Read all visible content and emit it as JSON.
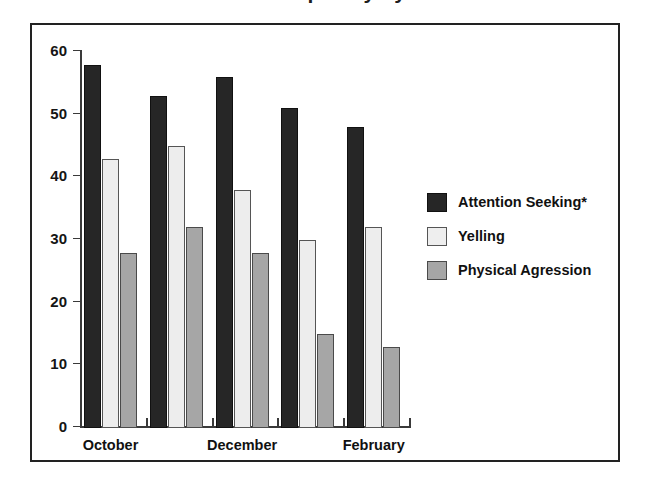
{
  "figure": {
    "title": "Behavior Frequency by Month",
    "frame_border_color": "#222222",
    "background": "#ffffff"
  },
  "chart_data": {
    "type": "bar",
    "title": "Behavior Frequency by Month",
    "xlabel": "",
    "ylabel": "",
    "ylim": [
      0,
      60
    ],
    "yticks": [
      0,
      10,
      20,
      30,
      40,
      50,
      60
    ],
    "ytick_labels": [
      "0",
      "10",
      "20",
      "30",
      "40",
      "50",
      "60"
    ],
    "grid": false,
    "legend_position": "right",
    "categories": [
      "October",
      "",
      "December",
      "",
      "February"
    ],
    "visible_category_labels": [
      "October",
      "December",
      "February"
    ],
    "series": [
      {
        "name": "Attention Seeking*",
        "color": "#262626",
        "values": [
          58,
          53,
          56,
          51,
          48
        ]
      },
      {
        "name": "Yelling",
        "color": "#ededed",
        "values": [
          43,
          45,
          38,
          30,
          32
        ]
      },
      {
        "name": "Physical Agression",
        "color": "#a6a6a6",
        "values": [
          28,
          32,
          28,
          15,
          13
        ]
      }
    ]
  },
  "legend": {
    "items": [
      {
        "label": "Attention Seeking*",
        "swatch": "s0"
      },
      {
        "label": "Yelling",
        "swatch": "s1"
      },
      {
        "label": "Physical Agression",
        "swatch": "s2"
      }
    ]
  }
}
